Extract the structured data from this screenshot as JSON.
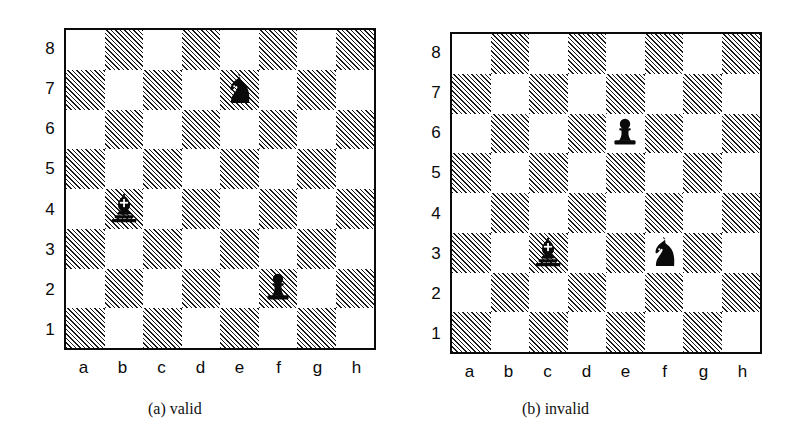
{
  "figure": {
    "caption_a": "(a) valid",
    "caption_b": "(b) invalid",
    "file_labels": [
      "a",
      "b",
      "c",
      "d",
      "e",
      "f",
      "g",
      "h"
    ],
    "rank_labels": [
      "8",
      "7",
      "6",
      "5",
      "4",
      "3",
      "2",
      "1"
    ],
    "colors": {
      "ink": "#0a0a0a",
      "hatch": "#1a1a1a",
      "light_square": "#ffffff",
      "piece_fill": "#0a0a0a",
      "background": "#ffffff"
    }
  },
  "chart_data": {
    "type": "table",
    "boards": [
      {
        "id": "board-a",
        "label": "(a) valid",
        "files": [
          "a",
          "b",
          "c",
          "d",
          "e",
          "f",
          "g",
          "h"
        ],
        "ranks": [
          "8",
          "7",
          "6",
          "5",
          "4",
          "3",
          "2",
          "1"
        ],
        "dark_square_pattern": "a1 dark; squares where (file_index + rank_index) is even are hatched",
        "pieces": [
          {
            "type": "knight",
            "color": "black",
            "square": "e7",
            "file": "e",
            "rank": 7
          },
          {
            "type": "bishop",
            "color": "black",
            "square": "b4",
            "file": "b",
            "rank": 4
          },
          {
            "type": "pawn",
            "color": "black",
            "square": "f2",
            "file": "f",
            "rank": 2
          }
        ],
        "piece_count": 3
      },
      {
        "id": "board-b",
        "label": "(b) invalid",
        "files": [
          "a",
          "b",
          "c",
          "d",
          "e",
          "f",
          "g",
          "h"
        ],
        "ranks": [
          "8",
          "7",
          "6",
          "5",
          "4",
          "3",
          "2",
          "1"
        ],
        "dark_square_pattern": "a1 dark; squares where (file_index + rank_index) is even are hatched",
        "pieces": [
          {
            "type": "pawn",
            "color": "black",
            "square": "e6",
            "file": "e",
            "rank": 6
          },
          {
            "type": "bishop",
            "color": "black",
            "square": "c3",
            "file": "c",
            "rank": 3
          },
          {
            "type": "knight",
            "color": "black",
            "square": "f3",
            "file": "f",
            "rank": 3
          }
        ],
        "piece_count": 3
      }
    ]
  }
}
